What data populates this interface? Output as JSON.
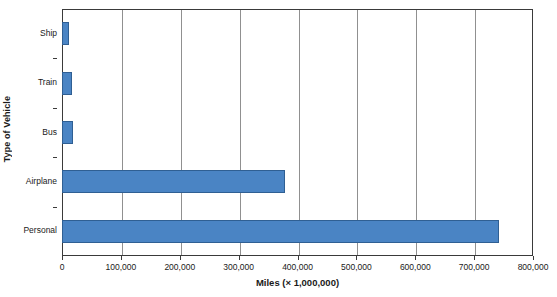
{
  "chart_data": {
    "type": "bar",
    "orientation": "horizontal",
    "title": "",
    "xlabel": "Miles (× 1,000,000)",
    "ylabel": "Type of Vehicle",
    "categories": [
      "Ship",
      "Train",
      "Bus",
      "Airplane",
      "Personal"
    ],
    "values": [
      12000,
      17000,
      18000,
      378000,
      742000
    ],
    "xlim": [
      0,
      800000
    ],
    "xticks": [
      0,
      100000,
      200000,
      300000,
      400000,
      500000,
      600000,
      700000,
      800000
    ],
    "xtick_labels": [
      "0",
      "100,000",
      "200,000",
      "300,000",
      "400,000",
      "500,000",
      "600,000",
      "700,000",
      "800,000"
    ],
    "grid": "vertical",
    "legend": "none",
    "bar_color": "#4a84c4",
    "bar_edge_color": "#2f5f93",
    "axis_color": "#3a3a3a",
    "gridline_color": "#909090"
  },
  "axes": {
    "x_title": "Miles (× 1,000,000)",
    "y_title": "Type of Vehicle"
  },
  "artifacts": {
    "top_cropped_text": ""
  }
}
